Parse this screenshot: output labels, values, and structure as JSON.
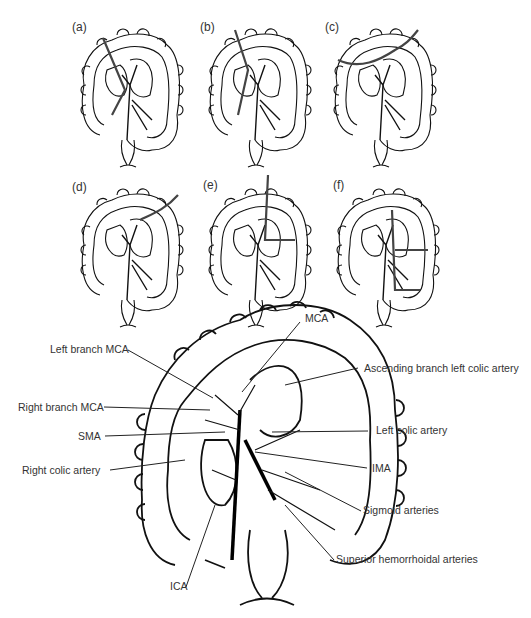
{
  "panels": [
    {
      "id": "a",
      "label": "(a)"
    },
    {
      "id": "b",
      "label": "(b)"
    },
    {
      "id": "c",
      "label": "(c)"
    },
    {
      "id": "d",
      "label": "(d)"
    },
    {
      "id": "e",
      "label": "(e)"
    },
    {
      "id": "f",
      "label": "(f)"
    }
  ],
  "main_diagram": {
    "labels": {
      "mca": "MCA",
      "left_branch_mca": "Left branch MCA",
      "ascending_branch_left_colic": "Ascending branch left colic artery",
      "right_branch_mca": "Right branch MCA",
      "sma": "SMA",
      "left_colic_artery": "Left colic artery",
      "right_colic_artery": "Right colic artery",
      "ima": "IMA",
      "sigmoid_arteries": "Sigmoid arteries",
      "superior_hemorrhoidal_arteries": "Superior hemorrhoidal arteries",
      "ica": "ICA"
    }
  },
  "colors": {
    "line": "#111111",
    "cut_line": "#444444",
    "text": "#333333"
  }
}
